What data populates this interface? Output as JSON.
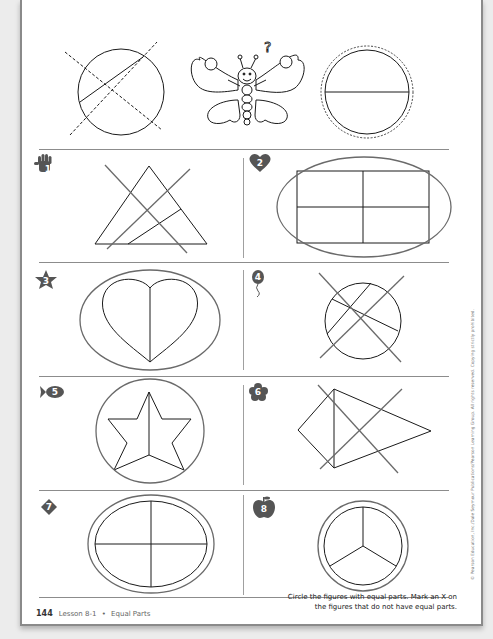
{
  "worksheet": {
    "page_number": "144",
    "lesson_label": "Lesson 8-1",
    "separator": "•",
    "topic": "Equal Parts",
    "instructions_line1": "Circle the figures with equal parts. Mark an X on",
    "instructions_line2": "the figures that do not have equal parts.",
    "copyright": "© Pearson Education, Inc./Dale Seymour Publications/Pearson Learning Group. All rights reserved. Copying strictly prohibited."
  },
  "example": {
    "figures": [
      {
        "shape": "circle",
        "divided": "unequal (diagonal line)",
        "marked": "X (dashed)"
      },
      {
        "shape": "butterfly mascot",
        "glyph": "?"
      },
      {
        "shape": "circle",
        "divided": "equal halves (horizontal line)",
        "marked": "circled (dashed)"
      }
    ]
  },
  "problems": [
    {
      "number": "1",
      "badge_icon": "hand",
      "shape": "triangle",
      "parts": "unequal",
      "answer_mark": "X"
    },
    {
      "number": "2",
      "badge_icon": "heart",
      "shape": "rectangle",
      "parts": "4 equal",
      "answer_mark": "circle"
    },
    {
      "number": "3",
      "badge_icon": "star",
      "shape": "heart",
      "parts": "2 equal",
      "answer_mark": "circle"
    },
    {
      "number": "4",
      "badge_icon": "balloon",
      "shape": "circle",
      "parts": "unequal",
      "answer_mark": "X"
    },
    {
      "number": "5",
      "badge_icon": "fish",
      "shape": "star",
      "parts": "2 equal",
      "answer_mark": "circle"
    },
    {
      "number": "6",
      "badge_icon": "flower",
      "shape": "kite",
      "parts": "unequal",
      "answer_mark": "X"
    },
    {
      "number": "7",
      "badge_icon": "diamond",
      "shape": "oval",
      "parts": "4 equal",
      "answer_mark": "circle"
    },
    {
      "number": "8",
      "badge_icon": "apple",
      "shape": "circle",
      "parts": "3 equal",
      "answer_mark": "circle"
    }
  ],
  "colors": {
    "badge": "#555555",
    "answer_mark": "#6a6a6a",
    "figure_stroke": "#1a1a1a"
  }
}
